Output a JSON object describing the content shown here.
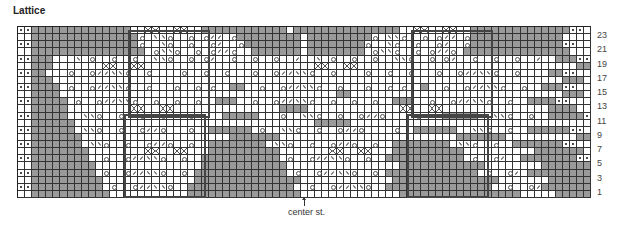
{
  "title": "Lattice",
  "center_label": "center st.",
  "row_numbers": [
    "23",
    "21",
    "19",
    "17",
    "15",
    "13",
    "11",
    "9",
    "7",
    "5",
    "3",
    "1"
  ],
  "legend_codes": {
    "g": "no stitch (grey)",
    ".": "knit",
    "d": "purl",
    "o": "yarn over",
    "/": "k2tog",
    "\\": "ssk",
    "x": "cable cross"
  },
  "colors": {
    "grey": "#9a9a9a",
    "line": "#333333",
    "outline": "#444444"
  },
  "grid": {
    "cols": 81,
    "rows": 24
  },
  "chart_rows": [
    "ddgggggggggggggg..xx..xx..gggggggggggg.ggggggggggggggg..xx..xx..ggggggggggggggdd",
    "..gggggggggggggggo.\\\\o..o.o//.oggggggggg.gggggggggo.\\\\o..o.o//.oggggggggggggg..",
    "ddgggggggggggggggo..\\o..o..o/..ogggggggg.ggggggggo..\\o..o..o/..ogggggggggggggdd",
    "..gggggggggggggggg.o\\\\o..o.o//o..ggggggg.gggggggg.o\\\\o..o.o//o.ggggggggggggggg..",
    "ddggg...\\.o..o..o..\\\\o..o.o/..o..o..o../..\\.o..o..o..\\\\o..o.o/..o..o..o../..gggdd",
    "..ggg.......xx..xx........................xx..xx...............................gg..",
    "ddgg...o..o//\\\\o..o....o..o..o...o..o//\\\\o..o....o..o..o...o..o//\\\\o..o....ggdd",
    "..ggg........................................................................ggg..",
    "ddgggg.o..o//\\\\o..o...o..o.o..gg..o..o//\\\\o..o...o..o.o..g..o..o//\\\\o..o..gggdd",
    "..gggg.......................................gg..............................ggg..",
    "ddggggg.o..o//\\\\o..o..o..o..ggg..o..o//\\\\o..o..o..o..ggg..o..o//\\\\o..o..ggggdd",
    "..ggggg.........xx..xx...............gggg.............xx..xx...............gggg..",
    "ddggggg..\\\\o..o..o//o...o....ggggg...o..\\\\o..o..o//o....o...ggggg..\\\\o..o..gggggdd",
    "..gggggg..................................ggggg..................................gggg..",
    "ddgggggg.\\\\o..o..o//o...o..gggggg.o..\\\\o..o..o//o....o..gggggg..\\\\o..o..ggggggdd",
    "..ggggggg.....................ggggggg.........................ggggggg..........ggggg..",
    "ddggggggg.\\\\o..o..o//o..o..gggggggg.\\\\o..o..o//o..o..gggggggg.\\\\o..o..gggggggdd",
    "..gggggggg........xx..xx...gggggggggg.......xx..xx...gggggggggg..........ggggggg..",
    "ddgggggggg..o..o//\\\\o..o..ggggggggggg.o..o//\\\\o..o..ggggggggggg.o..o/..ggggggggdd",
    "..ggggggggg...............gggggggggggg................gggggggggggg........ggggggg..",
    "ddggggggggg.o..o//\\\\o..o.ggggggggggggg.o..o//\\\\o..o.ggggggggggggg.o..o/.gggggggggdd",
    "..gggggggggg.............ggggggggggggggg.............ggggggggggggggg.......gggggggg..",
    "ddgggggggggg.o..o//\\\\o..ggggggggggggggg..o..o//\\\\o..ggggggggggggggg..o..o/ggggggggdd",
    "..ggggggggggg...........gggggggggggggggg..............ggggggggggggggggg.....ggggggggg.."
  ],
  "repeat_boxes": [
    {
      "left_col": 16,
      "right_col": 27,
      "jog_rows": [
        1,
        13
      ]
    },
    {
      "left_col": 55,
      "right_col": 66,
      "jog_rows": [
        1,
        13
      ]
    }
  ],
  "center_col": 40
}
